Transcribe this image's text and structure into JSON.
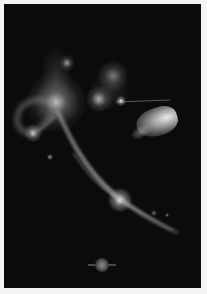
{
  "artwork": {
    "description": "Abstract dark poster with glowing light forms",
    "background_color": "#0b0b0b",
    "border_color": "#f4f4f4",
    "glows": [
      {
        "name": "left-bright-orb",
        "x": 56,
        "y": 102,
        "r": 22,
        "color": "#d8d8d8"
      },
      {
        "name": "left-small-orb",
        "x": 31,
        "y": 131,
        "r": 6,
        "color": "#e0e0e0"
      },
      {
        "name": "top-small-orb",
        "x": 66,
        "y": 61,
        "r": 5,
        "color": "#bdbdbd"
      },
      {
        "name": "center-upper-orb",
        "x": 113,
        "y": 75,
        "r": 12,
        "color": "#a0a0a0"
      },
      {
        "name": "center-left-orb",
        "x": 97,
        "y": 98,
        "r": 9,
        "color": "#c8c8c8"
      },
      {
        "name": "center-spark",
        "x": 121,
        "y": 102,
        "r": 3,
        "color": "#ffffff"
      },
      {
        "name": "teardrop-bright",
        "x": 168,
        "y": 120,
        "r": 12,
        "color": "#f0f0f0"
      },
      {
        "name": "curve-spark",
        "x": 118,
        "y": 198,
        "r": 7,
        "color": "#f5f5f5"
      },
      {
        "name": "lower-left-dot",
        "x": 49,
        "y": 155,
        "r": 2,
        "color": "#9a9a9a"
      },
      {
        "name": "right-dot-1",
        "x": 154,
        "y": 213,
        "r": 2,
        "color": "#777777"
      },
      {
        "name": "right-dot-2",
        "x": 167,
        "y": 214,
        "r": 1.5,
        "color": "#888888"
      }
    ]
  },
  "emblem": {
    "label": ""
  }
}
